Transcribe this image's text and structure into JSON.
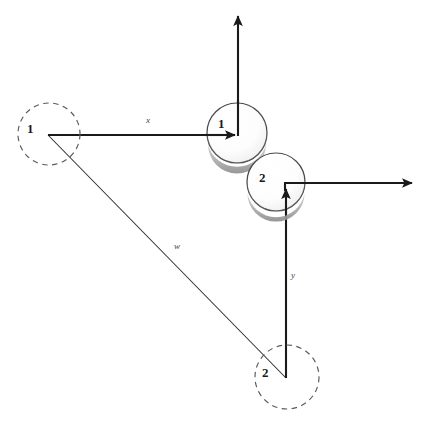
{
  "figure": {
    "background_color": "#ffffff",
    "stroke_color": "#1a1a1a",
    "dashed_stroke_color": "#555555",
    "sphere_fill": "#ffffff",
    "sphere_shadow_color": "#9a9a9a",
    "label_color": "#1a1a1a"
  },
  "bodies": [
    {
      "name": "initial-position-body-1",
      "label": "1",
      "style": "dashed-outline-circle",
      "cx": 49,
      "cy": 134,
      "r": 31,
      "label_x": 27,
      "label_y": 121
    },
    {
      "name": "current-position-body-1",
      "label": "1",
      "style": "shaded-sphere",
      "cx": 237,
      "cy": 133,
      "r": 30,
      "label_x": 218,
      "label_y": 116
    },
    {
      "name": "current-position-body-2",
      "label": "2",
      "style": "shaded-sphere",
      "cx": 276,
      "cy": 182,
      "r": 29,
      "label_x": 259,
      "label_y": 170
    },
    {
      "name": "initial-position-body-2",
      "label": "2",
      "style": "dashed-outline-circle",
      "cx": 287,
      "cy": 377,
      "r": 32,
      "label_x": 262,
      "label_y": 365
    }
  ],
  "vectors": [
    {
      "name": "vector-x",
      "label": "x",
      "from": [
        48,
        135
      ],
      "to": [
        238,
        135
      ],
      "label_x": 146,
      "label_y": 115,
      "arrowhead": true
    },
    {
      "name": "vector-y",
      "label": "y",
      "from": [
        286,
        378
      ],
      "to": [
        286,
        186
      ],
      "label_x": 291,
      "label_y": 270,
      "arrowhead": true
    },
    {
      "name": "vector-w",
      "label": "w",
      "from": [
        48,
        135
      ],
      "to": [
        286,
        378
      ],
      "label_x": 174,
      "label_y": 241,
      "arrowhead": false
    },
    {
      "name": "axis-body-1-vertical",
      "label": "",
      "from": [
        238,
        135
      ],
      "to": [
        238,
        13
      ],
      "label_x": 0,
      "label_y": 0,
      "arrowhead": true
    },
    {
      "name": "axis-body-2-horizontal",
      "label": "",
      "from": [
        284,
        183
      ],
      "to": [
        415,
        183
      ],
      "label_x": 0,
      "label_y": 0,
      "arrowhead": true
    }
  ]
}
